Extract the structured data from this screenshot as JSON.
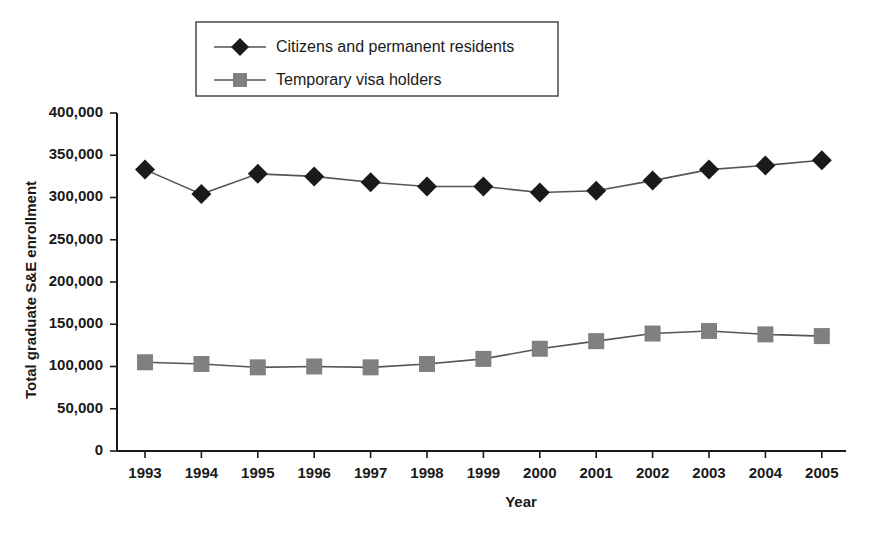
{
  "chart_data": {
    "type": "line",
    "title": "",
    "xlabel": "Year",
    "ylabel": "Total graduate S&E enrollment",
    "categories": [
      "1993",
      "1994",
      "1995",
      "1996",
      "1997",
      "1998",
      "1999",
      "2000",
      "2001",
      "2002",
      "2003",
      "2004",
      "2005"
    ],
    "x": [
      1993,
      1994,
      1995,
      1996,
      1997,
      1998,
      1999,
      2000,
      2001,
      2002,
      2003,
      2004,
      2005
    ],
    "xlim": [
      1993,
      2005
    ],
    "ylim": [
      0,
      400000
    ],
    "y_ticks": [
      0,
      50000,
      100000,
      150000,
      200000,
      250000,
      300000,
      350000,
      400000
    ],
    "y_tick_labels": [
      "0",
      "50,000",
      "100,000",
      "150,000",
      "200,000",
      "250,000",
      "300,000",
      "350,000",
      "400,000"
    ],
    "grid": false,
    "legend_position": "top-center",
    "series": [
      {
        "name": "Citizens and permanent residents",
        "marker": "diamond",
        "marker_color": "#1a1a1a",
        "line_color": "#555555",
        "values": [
          333000,
          304000,
          328000,
          325000,
          318000,
          313000,
          313000,
          306000,
          308000,
          320000,
          333000,
          338000,
          344000
        ]
      },
      {
        "name": "Temporary visa holders",
        "marker": "square",
        "marker_color": "#808080",
        "line_color": "#808080",
        "values": [
          105000,
          103000,
          99000,
          100000,
          99000,
          103000,
          109000,
          121000,
          130000,
          139000,
          142000,
          138000,
          136000
        ]
      }
    ]
  },
  "legend": {
    "items": [
      {
        "label": "Citizens and permanent residents"
      },
      {
        "label": "Temporary visa holders"
      }
    ]
  },
  "colors": {
    "series1_marker": "#1a1a1a",
    "series2_marker": "#808080",
    "line": "#555555",
    "axis": "#1a1a1a",
    "background": "#ffffff"
  }
}
